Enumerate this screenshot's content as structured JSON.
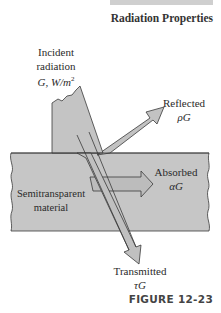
{
  "header": {
    "section_title": "Radiation Properties"
  },
  "diagram": {
    "material_label": [
      "Semitransparent",
      "material"
    ],
    "incident": {
      "label": [
        "Incident",
        "radiation"
      ],
      "symbol": "G, W/m",
      "superscript": "2"
    },
    "reflected": {
      "label": "Reflected",
      "symbol": "ρG"
    },
    "absorbed": {
      "label": "Absorbed",
      "symbol": "αG"
    },
    "transmitted": {
      "label": "Transmitted",
      "symbol": "τG"
    },
    "colors": {
      "fill": "#c4c4c4",
      "stroke": "#3a3a3a",
      "text": "#2a2a2a"
    }
  },
  "footer": {
    "figure_label": "FIGURE 12-23"
  }
}
